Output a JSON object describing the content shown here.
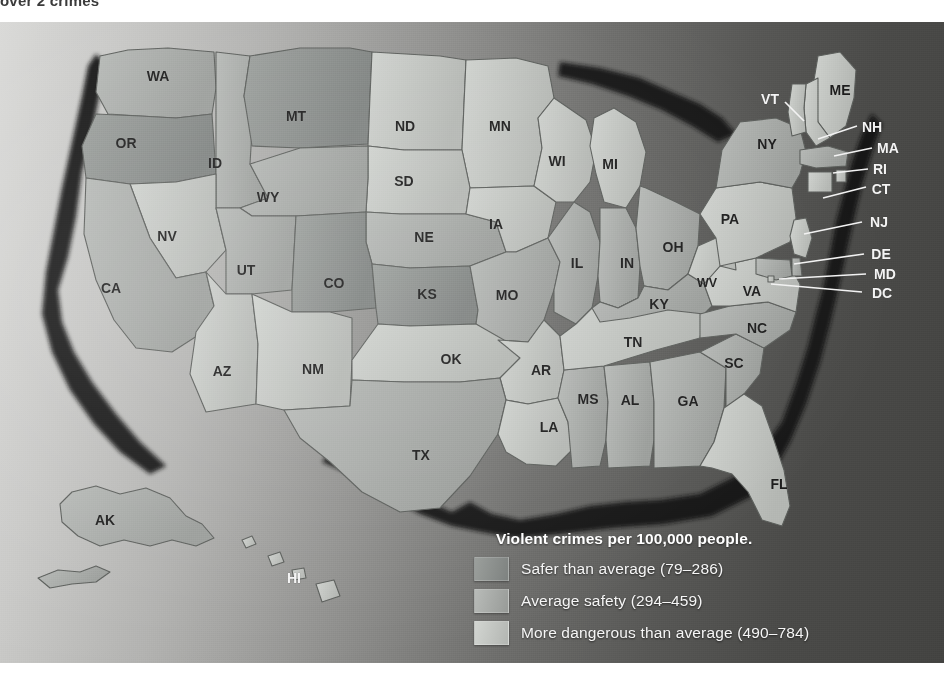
{
  "top_caption": "over 2  crimes  ",
  "map": {
    "title": "United States violent crime rate by state",
    "background": {
      "ocean_light": "#d8d8d6",
      "ocean_dark": "#434341",
      "coast_shadow": "#1a1a1a"
    },
    "class_colors": {
      "safer": "#8e9290",
      "average": "#a9aca9",
      "dangerous": "#c3c6c2"
    }
  },
  "legend": {
    "title": "Violent crimes per 100,000 people.",
    "items": [
      {
        "label": "Safer than average (79–286)",
        "color": "#8e9290",
        "range_low": 79,
        "range_high": 286
      },
      {
        "label": "Average safety (294–459)",
        "color": "#a9aca9",
        "range_low": 294,
        "range_high": 459
      },
      {
        "label": "More dangerous than average (490–784)",
        "color": "#c3c6c2",
        "range_low": 490,
        "range_high": 784
      }
    ]
  },
  "chart_data": {
    "type": "heatmap",
    "title": "Violent crimes per 100,000 people.",
    "categories": [
      "Safer than average (79–286)",
      "Average safety (294–459)",
      "More dangerous than average (490–784)"
    ],
    "legend_position": "bottom-right",
    "grid": false,
    "states": [
      {
        "code": "WA",
        "class": "average"
      },
      {
        "code": "OR",
        "class": "safer"
      },
      {
        "code": "ID",
        "class": "average"
      },
      {
        "code": "MT",
        "class": "safer"
      },
      {
        "code": "ND",
        "class": "dangerous"
      },
      {
        "code": "MN",
        "class": "dangerous"
      },
      {
        "code": "WI",
        "class": "dangerous"
      },
      {
        "code": "MI",
        "class": "dangerous"
      },
      {
        "code": "WY",
        "class": "average"
      },
      {
        "code": "SD",
        "class": "dangerous"
      },
      {
        "code": "IA",
        "class": "dangerous"
      },
      {
        "code": "IL",
        "class": "average"
      },
      {
        "code": "IN",
        "class": "average"
      },
      {
        "code": "OH",
        "class": "average"
      },
      {
        "code": "PA",
        "class": "dangerous"
      },
      {
        "code": "NY",
        "class": "average"
      },
      {
        "code": "NV",
        "class": "dangerous"
      },
      {
        "code": "UT",
        "class": "average"
      },
      {
        "code": "CO",
        "class": "safer"
      },
      {
        "code": "NE",
        "class": "average"
      },
      {
        "code": "KS",
        "class": "safer"
      },
      {
        "code": "MO",
        "class": "average"
      },
      {
        "code": "KY",
        "class": "average"
      },
      {
        "code": "WV",
        "class": "dangerous"
      },
      {
        "code": "VA",
        "class": "dangerous"
      },
      {
        "code": "CA",
        "class": "average"
      },
      {
        "code": "AZ",
        "class": "dangerous"
      },
      {
        "code": "NM",
        "class": "dangerous"
      },
      {
        "code": "OK",
        "class": "dangerous"
      },
      {
        "code": "AR",
        "class": "dangerous"
      },
      {
        "code": "TN",
        "class": "dangerous"
      },
      {
        "code": "NC",
        "class": "average"
      },
      {
        "code": "SC",
        "class": "average"
      },
      {
        "code": "MS",
        "class": "average"
      },
      {
        "code": "AL",
        "class": "average"
      },
      {
        "code": "GA",
        "class": "average"
      },
      {
        "code": "LA",
        "class": "dangerous"
      },
      {
        "code": "TX",
        "class": "average"
      },
      {
        "code": "FL",
        "class": "dangerous"
      },
      {
        "code": "ME",
        "class": "dangerous"
      },
      {
        "code": "NH",
        "class": "dangerous"
      },
      {
        "code": "VT",
        "class": "dangerous"
      },
      {
        "code": "MA",
        "class": "average"
      },
      {
        "code": "RI",
        "class": "dangerous"
      },
      {
        "code": "CT",
        "class": "dangerous"
      },
      {
        "code": "NJ",
        "class": "dangerous"
      },
      {
        "code": "DE",
        "class": "average"
      },
      {
        "code": "MD",
        "class": "average"
      },
      {
        "code": "DC",
        "class": "dangerous"
      },
      {
        "code": "AK",
        "class": "average"
      },
      {
        "code": "HI",
        "class": "dangerous"
      }
    ]
  },
  "state_labels": [
    {
      "code": "WA",
      "x": 158,
      "y": 55
    },
    {
      "code": "OR",
      "x": 126,
      "y": 122
    },
    {
      "code": "ID",
      "x": 215,
      "y": 142
    },
    {
      "code": "MT",
      "x": 296,
      "y": 95
    },
    {
      "code": "ND",
      "x": 405,
      "y": 105
    },
    {
      "code": "MN",
      "x": 500,
      "y": 105
    },
    {
      "code": "SD",
      "x": 404,
      "y": 160
    },
    {
      "code": "WI",
      "x": 557,
      "y": 140
    },
    {
      "code": "MI",
      "x": 610,
      "y": 143
    },
    {
      "code": "WY",
      "x": 268,
      "y": 176
    },
    {
      "code": "NE",
      "x": 424,
      "y": 216
    },
    {
      "code": "IA",
      "x": 496,
      "y": 203
    },
    {
      "code": "IL",
      "x": 577,
      "y": 242
    },
    {
      "code": "IN",
      "x": 627,
      "y": 242
    },
    {
      "code": "OH",
      "x": 673,
      "y": 226
    },
    {
      "code": "PA",
      "x": 730,
      "y": 198
    },
    {
      "code": "NY",
      "x": 767,
      "y": 123
    },
    {
      "code": "NV",
      "x": 167,
      "y": 215
    },
    {
      "code": "UT",
      "x": 246,
      "y": 249
    },
    {
      "code": "CO",
      "x": 334,
      "y": 262
    },
    {
      "code": "KS",
      "x": 427,
      "y": 273
    },
    {
      "code": "MO",
      "x": 507,
      "y": 274
    },
    {
      "code": "KY",
      "x": 659,
      "y": 283
    },
    {
      "code": "WV",
      "x": 707,
      "y": 262
    },
    {
      "code": "VA",
      "x": 752,
      "y": 270
    },
    {
      "code": "CA",
      "x": 111,
      "y": 267
    },
    {
      "code": "AZ",
      "x": 222,
      "y": 350
    },
    {
      "code": "NM",
      "x": 313,
      "y": 348
    },
    {
      "code": "OK",
      "x": 451,
      "y": 338
    },
    {
      "code": "AR",
      "x": 541,
      "y": 349
    },
    {
      "code": "TN",
      "x": 633,
      "y": 321
    },
    {
      "code": "NC",
      "x": 757,
      "y": 307
    },
    {
      "code": "SC",
      "x": 734,
      "y": 342
    },
    {
      "code": "MS",
      "x": 588,
      "y": 378
    },
    {
      "code": "AL",
      "x": 630,
      "y": 379
    },
    {
      "code": "GA",
      "x": 688,
      "y": 380
    },
    {
      "code": "LA",
      "x": 549,
      "y": 406
    },
    {
      "code": "TX",
      "x": 421,
      "y": 434
    },
    {
      "code": "FL",
      "x": 779,
      "y": 463
    },
    {
      "code": "ME",
      "x": 840,
      "y": 69
    },
    {
      "code": "AK",
      "x": 105,
      "y": 499
    },
    {
      "code": "HI",
      "x": 294,
      "y": 557
    }
  ],
  "callout_labels": [
    {
      "code": "VT",
      "x": 770,
      "y": 78,
      "lx": 803,
      "ly": 100
    },
    {
      "code": "NH",
      "x": 872,
      "y": 106,
      "lx": 818,
      "ly": 118
    },
    {
      "code": "MA",
      "x": 888,
      "y": 127,
      "lx": 833,
      "ly": 135
    },
    {
      "code": "RI",
      "x": 880,
      "y": 148,
      "lx": 832,
      "ly": 152
    },
    {
      "code": "CT",
      "x": 881,
      "y": 168,
      "lx": 822,
      "ly": 178
    },
    {
      "code": "NJ",
      "x": 879,
      "y": 201,
      "lx": 803,
      "ly": 213
    },
    {
      "code": "DE",
      "x": 881,
      "y": 233,
      "lx": 793,
      "ly": 243
    },
    {
      "code": "MD",
      "x": 885,
      "y": 253,
      "lx": 778,
      "ly": 258
    },
    {
      "code": "DC",
      "x": 882,
      "y": 272,
      "lx": 770,
      "ly": 263
    }
  ]
}
